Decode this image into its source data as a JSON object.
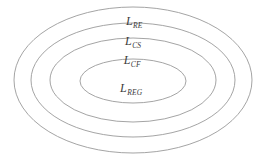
{
  "diagram": {
    "type": "nested-ellipses",
    "background_color": "#ffffff",
    "stroke_color": "#9a9a9a",
    "text_color": "#3a3a3a",
    "rings": [
      {
        "id": "outer",
        "name": "L_RE",
        "base": "L",
        "subscript": "RE",
        "label_x": 134,
        "label_y": 20,
        "cx": 133,
        "cy": 80,
        "rx": 119,
        "ry": 73
      },
      {
        "id": "second",
        "name": "L_CS",
        "base": "L",
        "subscript": "CS",
        "label_x": 133,
        "label_y": 40,
        "cx": 133,
        "cy": 80,
        "rx": 102,
        "ry": 57
      },
      {
        "id": "third",
        "name": "L_CF",
        "base": "L",
        "subscript": "CF",
        "label_x": 132,
        "label_y": 59,
        "cx": 133,
        "cy": 80,
        "rx": 83,
        "ry": 42
      },
      {
        "id": "inner",
        "name": "L_REG",
        "base": "L",
        "subscript": "REG",
        "label_x": 131,
        "label_y": 87,
        "cx": 133,
        "cy": 81,
        "rx": 53,
        "ry": 22
      }
    ]
  }
}
